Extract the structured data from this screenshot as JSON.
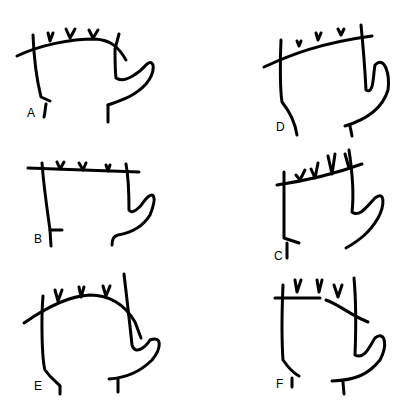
{
  "figure": {
    "type": "line-drawing",
    "panels": [
      {
        "label": "A",
        "top_line": "curved arc",
        "finger_marks": 3
      },
      {
        "label": "B",
        "top_line": "straight horizontal",
        "finger_marks": 3
      },
      {
        "label": "C",
        "top_line": "strongly curved arc",
        "finger_marks": 3
      },
      {
        "label": "D",
        "top_line": "straight oblique",
        "finger_marks": 3
      },
      {
        "label": "E",
        "top_line": "straight oblique",
        "finger_marks": 4
      },
      {
        "label": "F",
        "top_line": "broken / split",
        "finger_marks": 4
      }
    ]
  },
  "stroke_color": "#000000",
  "background": "#ffffff"
}
